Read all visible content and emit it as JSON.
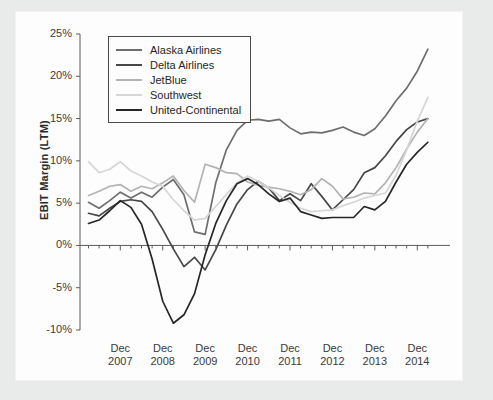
{
  "chart_data": {
    "type": "line",
    "title": "",
    "xlabel": "",
    "ylabel": "EBIT Margin (LTM)",
    "ylim": [
      -10,
      25
    ],
    "xlim": [
      2007.0,
      2015.25
    ],
    "grid": false,
    "legend_position": "top-left",
    "ytick_labels": [
      "25%",
      "20%",
      "15%",
      "10%",
      "5%",
      "0%",
      "-5%",
      "-10%"
    ],
    "ytick_values": [
      25,
      20,
      15,
      10,
      5,
      0,
      -5,
      -10
    ],
    "xtick_labels": [
      {
        "line1": "Dec",
        "line2": "2007"
      },
      {
        "line1": "Dec",
        "line2": "2008"
      },
      {
        "line1": "Dec",
        "line2": "2009"
      },
      {
        "line1": "Dec",
        "line2": "2010"
      },
      {
        "line1": "Dec",
        "line2": "2011"
      },
      {
        "line1": "Dec",
        "line2": "2012"
      },
      {
        "line1": "Dec",
        "line2": "2013"
      },
      {
        "line1": "Dec",
        "line2": "2014"
      }
    ],
    "xtick_values": [
      2007.95,
      2008.95,
      2009.95,
      2010.95,
      2011.95,
      2012.95,
      2013.95,
      2014.95
    ],
    "x": [
      2007.2,
      2007.45,
      2007.7,
      2007.95,
      2008.2,
      2008.45,
      2008.7,
      2008.95,
      2009.2,
      2009.45,
      2009.7,
      2009.95,
      2010.2,
      2010.45,
      2010.7,
      2010.95,
      2011.2,
      2011.45,
      2011.7,
      2011.95,
      2012.2,
      2012.45,
      2012.7,
      2012.95,
      2013.2,
      2013.45,
      2013.7,
      2013.95,
      2014.2,
      2014.45,
      2014.7,
      2014.95,
      2015.2
    ],
    "series": [
      {
        "name": "Alaska Airlines",
        "color": "#6e6e6e",
        "values": [
          5.1,
          4.4,
          5.3,
          6.3,
          5.6,
          6.3,
          5.7,
          6.9,
          7.8,
          6.0,
          1.6,
          1.3,
          7.4,
          11.3,
          13.6,
          14.8,
          14.9,
          14.7,
          14.9,
          13.9,
          13.2,
          13.4,
          13.3,
          13.6,
          14.0,
          13.4,
          13.0,
          13.8,
          15.3,
          17.1,
          18.6,
          20.6,
          23.2
        ]
      },
      {
        "name": "Delta Airlines",
        "color": "#474747",
        "values": [
          3.8,
          3.5,
          4.4,
          5.2,
          5.4,
          5.2,
          4.0,
          1.9,
          -0.4,
          -2.5,
          -1.4,
          -2.9,
          -0.5,
          2.4,
          4.9,
          6.6,
          7.6,
          6.8,
          5.3,
          6.1,
          5.3,
          7.3,
          5.8,
          4.2,
          5.4,
          6.6,
          8.6,
          9.2,
          10.6,
          12.3,
          13.7,
          14.6,
          15.0
        ]
      },
      {
        "name": "JetBlue",
        "color": "#b3b3b3",
        "values": [
          5.9,
          6.4,
          7.0,
          7.2,
          6.4,
          7.0,
          6.7,
          7.4,
          8.2,
          6.5,
          5.1,
          9.6,
          9.2,
          8.6,
          8.5,
          7.5,
          7.1,
          6.9,
          6.7,
          6.4,
          6.0,
          6.6,
          7.9,
          7.0,
          5.5,
          5.7,
          6.2,
          6.1,
          7.4,
          9.2,
          11.4,
          13.4,
          15.0
        ]
      },
      {
        "name": "Southwest",
        "color": "#d6d6d6",
        "values": [
          9.9,
          8.6,
          9.0,
          9.9,
          8.8,
          8.2,
          7.5,
          7.0,
          5.4,
          4.1,
          3.0,
          3.2,
          4.6,
          6.0,
          7.4,
          8.2,
          7.6,
          6.8,
          5.9,
          5.1,
          4.4,
          4.0,
          4.1,
          4.2,
          4.7,
          5.1,
          5.6,
          5.9,
          6.2,
          8.3,
          11.3,
          14.7,
          17.5
        ]
      },
      {
        "name": "United-Continental",
        "color": "#262626",
        "values": [
          2.6,
          3.0,
          4.1,
          5.3,
          4.5,
          2.5,
          -1.6,
          -6.6,
          -9.2,
          -8.2,
          -5.7,
          -1.1,
          2.6,
          5.3,
          7.3,
          7.9,
          7.2,
          6.1,
          5.2,
          5.6,
          4.0,
          3.6,
          3.2,
          3.3,
          3.3,
          3.3,
          4.6,
          4.2,
          5.2,
          7.5,
          9.6,
          11.0,
          12.2
        ]
      }
    ]
  },
  "legend": {
    "items": [
      {
        "label": "Alaska Airlines",
        "color": "#6e6e6e"
      },
      {
        "label": "Delta Airlines",
        "color": "#474747"
      },
      {
        "label": "JetBlue",
        "color": "#b3b3b3"
      },
      {
        "label": "Southwest",
        "color": "#d6d6d6"
      },
      {
        "label": "United-Continental",
        "color": "#262626"
      }
    ]
  }
}
